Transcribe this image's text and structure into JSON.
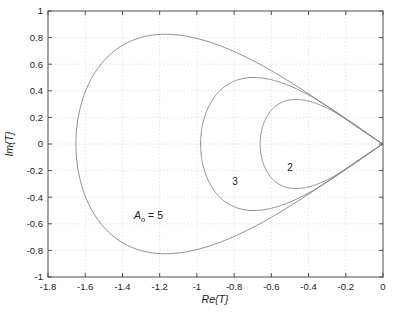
{
  "chart_data": {
    "type": "line",
    "title": "",
    "xlabel": "Re{T}",
    "ylabel": "Im{T}",
    "xlim": [
      -1.8,
      0
    ],
    "ylim": [
      -1,
      1
    ],
    "xticks": [
      -1.8,
      -1.6,
      -1.4,
      -1.2,
      -1,
      -0.8,
      -0.6,
      -0.4,
      -0.2,
      0
    ],
    "yticks": [
      -1,
      -0.8,
      -0.6,
      -0.4,
      -0.2,
      0,
      0.2,
      0.4,
      0.6,
      0.8,
      1
    ],
    "xticklabels": [
      "-1.8",
      "-1.6",
      "-1.4",
      "-1.2",
      "-1",
      "-0.8",
      "-0.6",
      "-0.4",
      "-0.2",
      "0"
    ],
    "yticklabels": [
      "-1",
      "-0.8",
      "-0.6",
      "-0.4",
      "-0.2",
      "0",
      "0.2",
      "0.4",
      "0.6",
      "0.8",
      "1"
    ],
    "grid": true,
    "grid_style": "dotted",
    "grid_color": "#c8c8c8",
    "legend": "none",
    "line_color": "#808080",
    "series": [
      {
        "name": "A_o = 5",
        "label": "A",
        "label_sub": "o",
        "label_tail": " = 5",
        "label_x": -1.26,
        "label_y": -0.565,
        "leftmost_re": -1.65,
        "max_im": 0.825,
        "min_im": -0.825,
        "points": [
          [
            0,
            0
          ],
          [
            -0.0352,
            0.1085
          ],
          [
            -0.0902,
            0.1942
          ],
          [
            -0.1621,
            0.2678
          ],
          [
            -0.2478,
            0.3333
          ],
          [
            -0.3444,
            0.3924
          ],
          [
            -0.4494,
            0.4458
          ],
          [
            -0.5605,
            0.4934
          ],
          [
            -0.6757,
            0.5348
          ],
          [
            -0.7932,
            0.5694
          ],
          [
            -0.9114,
            0.5963
          ],
          [
            -1.0289,
            0.6145
          ],
          [
            -1.1442,
            0.6229
          ],
          [
            -1.2561,
            0.6201
          ],
          [
            -1.3631,
            0.6049
          ],
          [
            -1.4638,
            0.5757
          ],
          [
            -1.5568,
            0.5312
          ],
          [
            -1.6404,
            0.4702
          ],
          [
            -1.7129,
            0.3919
          ],
          [
            -1.7723,
            0.2963
          ],
          [
            -1.8166,
            0.1845
          ],
          [
            -1.844,
            0.0591
          ],
          [
            -1.8528,
            -0.0752
          ],
          [
            -1.842,
            -0.2114
          ],
          [
            -1.8111,
            -0.3414
          ],
          [
            -1.7606,
            -0.4568
          ],
          [
            -1.692,
            -0.5502
          ],
          [
            -1.6078,
            -0.6159
          ],
          [
            -1.511,
            -0.6508
          ],
          [
            -1.4052,
            -0.6549
          ],
          [
            -1.2938,
            -0.6307
          ],
          [
            -1.1799,
            -0.5826
          ],
          [
            -1.0662,
            -0.5159
          ],
          [
            -0.9546,
            -0.436
          ],
          [
            -0.8466,
            -0.3479
          ],
          [
            -0.7432,
            -0.2559
          ],
          [
            -0.6449,
            -0.1633
          ],
          [
            -0.5521,
            -0.0728
          ],
          [
            -0.465,
            0.0137
          ],
          [
            -0.3836,
            0.0945
          ],
          [
            -0.308,
            0.1684
          ]
        ]
      },
      {
        "name": "3",
        "label": "3",
        "label_x": -0.795,
        "label_y": -0.305,
        "leftmost_re": -0.98,
        "max_im": 0.5,
        "min_im": -0.5
      },
      {
        "name": "2",
        "label": "2",
        "label_x": -0.5,
        "label_y": -0.205,
        "leftmost_re": -0.66,
        "max_im": 0.335,
        "min_im": -0.335
      }
    ]
  },
  "axes": {
    "box_color": "#4d4d4d",
    "background": "#ffffff"
  }
}
